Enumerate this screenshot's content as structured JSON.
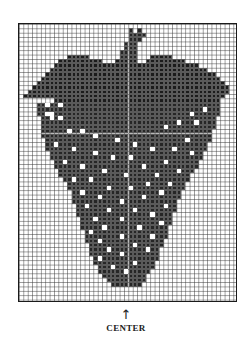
{
  "chart": {
    "title": "",
    "type": "needlework pattern chart",
    "grid": {
      "cols": 50,
      "rows": 63,
      "cell_px": 4.38
    },
    "colors": {
      "filled": "#262626",
      "leaf": "#1c1c1c",
      "seed": "#ffffff",
      "grid_line": "#5a5a5a",
      "frame": "#1a1a1a"
    },
    "stem_rows": [
      [
        1,
        25,
        25
      ],
      [
        1,
        27,
        27
      ],
      [
        2,
        25,
        28
      ],
      [
        3,
        25,
        27
      ],
      [
        4,
        24,
        26
      ],
      [
        5,
        24,
        26
      ],
      [
        6,
        23,
        26
      ],
      [
        7,
        23,
        26
      ]
    ],
    "leaf_rows": [
      [
        7,
        11,
        15
      ],
      [
        7,
        30,
        34
      ],
      [
        8,
        9,
        18
      ],
      [
        8,
        22,
        26
      ],
      [
        8,
        29,
        37
      ],
      [
        9,
        8,
        40
      ],
      [
        10,
        7,
        42
      ],
      [
        11,
        6,
        44
      ],
      [
        12,
        5,
        45
      ],
      [
        13,
        4,
        46
      ],
      [
        14,
        3,
        47
      ],
      [
        15,
        2,
        47
      ],
      [
        16,
        1,
        8
      ],
      [
        16,
        9,
        46
      ],
      [
        17,
        8,
        45
      ],
      [
        17,
        38,
        44
      ]
    ],
    "body_rows": [
      [
        18,
        4,
        45
      ],
      [
        19,
        4,
        45
      ],
      [
        20,
        4,
        45
      ],
      [
        21,
        5,
        44
      ],
      [
        22,
        5,
        44
      ],
      [
        23,
        5,
        44
      ],
      [
        24,
        5,
        43
      ],
      [
        25,
        5,
        43
      ],
      [
        26,
        6,
        43
      ],
      [
        27,
        6,
        42
      ],
      [
        28,
        6,
        42
      ],
      [
        29,
        7,
        41
      ],
      [
        30,
        7,
        41
      ],
      [
        31,
        8,
        40
      ],
      [
        32,
        8,
        40
      ],
      [
        33,
        9,
        39
      ],
      [
        34,
        9,
        38
      ],
      [
        35,
        10,
        38
      ],
      [
        36,
        11,
        37
      ],
      [
        37,
        11,
        37
      ],
      [
        38,
        12,
        36
      ],
      [
        39,
        12,
        36
      ],
      [
        40,
        12,
        35
      ],
      [
        41,
        13,
        35
      ],
      [
        42,
        13,
        35
      ],
      [
        43,
        13,
        34
      ],
      [
        44,
        14,
        34
      ],
      [
        45,
        14,
        34
      ],
      [
        46,
        14,
        33
      ],
      [
        47,
        15,
        33
      ],
      [
        48,
        15,
        33
      ],
      [
        49,
        15,
        32
      ],
      [
        50,
        16,
        32
      ],
      [
        51,
        16,
        31
      ],
      [
        52,
        16,
        31
      ],
      [
        53,
        17,
        31
      ],
      [
        54,
        17,
        30
      ],
      [
        55,
        18,
        30
      ],
      [
        56,
        18,
        29
      ],
      [
        57,
        19,
        28
      ],
      [
        58,
        20,
        28
      ],
      [
        59,
        21,
        27
      ]
    ],
    "seeds": [
      [
        18,
        6
      ],
      [
        18,
        9
      ],
      [
        19,
        42
      ],
      [
        20,
        6
      ],
      [
        20,
        7
      ],
      [
        21,
        7
      ],
      [
        21,
        9
      ],
      [
        20,
        39
      ],
      [
        22,
        36
      ],
      [
        22,
        40
      ],
      [
        23,
        33
      ],
      [
        24,
        11
      ],
      [
        24,
        14
      ],
      [
        25,
        17
      ],
      [
        26,
        38
      ],
      [
        26,
        22
      ],
      [
        27,
        8
      ],
      [
        27,
        26
      ],
      [
        28,
        12
      ],
      [
        28,
        30
      ],
      [
        28,
        35
      ],
      [
        29,
        17
      ],
      [
        29,
        39
      ],
      [
        30,
        21
      ],
      [
        30,
        25
      ],
      [
        31,
        10
      ],
      [
        31,
        33
      ],
      [
        32,
        14
      ],
      [
        32,
        28
      ],
      [
        33,
        19
      ],
      [
        33,
        36
      ],
      [
        34,
        24
      ],
      [
        34,
        31
      ],
      [
        35,
        12
      ],
      [
        35,
        16
      ],
      [
        36,
        29
      ],
      [
        36,
        34
      ],
      [
        37,
        20
      ],
      [
        37,
        25
      ],
      [
        38,
        14
      ],
      [
        38,
        32
      ],
      [
        39,
        18
      ],
      [
        39,
        28
      ],
      [
        40,
        23
      ],
      [
        41,
        15
      ],
      [
        41,
        33
      ],
      [
        42,
        20
      ],
      [
        42,
        26
      ],
      [
        43,
        30
      ],
      [
        44,
        17
      ],
      [
        44,
        23
      ],
      [
        45,
        32
      ],
      [
        46,
        19
      ],
      [
        46,
        27
      ],
      [
        47,
        16
      ],
      [
        48,
        23
      ],
      [
        48,
        30
      ],
      [
        49,
        18
      ],
      [
        50,
        26
      ],
      [
        51,
        20
      ],
      [
        51,
        29
      ],
      [
        52,
        23
      ],
      [
        53,
        18
      ],
      [
        54,
        26
      ],
      [
        55,
        21
      ],
      [
        56,
        24
      ]
    ]
  },
  "marker": {
    "arrow": "↑",
    "label": "CENTER"
  }
}
